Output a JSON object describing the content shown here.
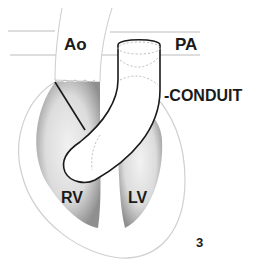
{
  "diagram": {
    "labels": {
      "aorta": "Ao",
      "pulmonary_artery": "PA",
      "conduit": "-CONDUIT",
      "right_ventricle": "RV",
      "left_ventricle": "LV",
      "figure_number": "3"
    },
    "colors": {
      "outline": "#1a1a1a",
      "ventricle_fill": "#d9d9d9",
      "ventricle_shade": "#9a9a9a",
      "heart_outline": "#cfcfcf",
      "dashed": "#bdbdbd"
    }
  }
}
